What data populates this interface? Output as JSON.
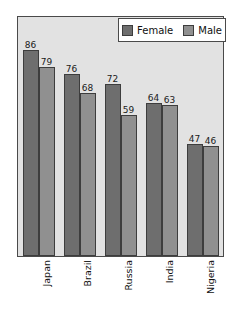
{
  "chart_data": {
    "type": "bar",
    "title": "",
    "subtitle": "",
    "xlabel": "",
    "ylabel": "",
    "ylim": [
      0,
      100
    ],
    "grid": false,
    "legend_position": "top-right",
    "categories": [
      "Japan",
      "Brazil",
      "Russia",
      "India",
      "Nigeria"
    ],
    "series": [
      {
        "name": "Female",
        "color": "#6e6e6e",
        "values": [
          86,
          76,
          72,
          64,
          47
        ]
      },
      {
        "name": "Male",
        "color": "#909090",
        "values": [
          79,
          68,
          59,
          63,
          46
        ]
      }
    ],
    "value_labels": [
      [
        "86",
        "79"
      ],
      [
        "76",
        "68"
      ],
      [
        "72",
        "59"
      ],
      [
        "64",
        "63"
      ],
      [
        "47",
        "46"
      ]
    ]
  },
  "legend": {
    "entries": [
      {
        "label": "Female",
        "swatch": "legend-swatch-female"
      },
      {
        "label": "Male",
        "swatch": "legend-swatch-male"
      }
    ]
  },
  "axis": {
    "categories": [
      "Japan",
      "Brazil",
      "Russia",
      "India",
      "Nigeria"
    ]
  },
  "colors": {
    "plot_background": "#e2e2e2",
    "plot_border": "#4a4a4a",
    "female": "#6e6e6e",
    "male": "#909090",
    "text": "#111111",
    "page_background": "#ffffff"
  }
}
